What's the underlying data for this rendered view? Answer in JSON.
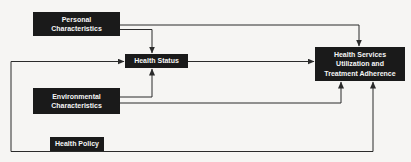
{
  "diagram": {
    "type": "flow-diagram",
    "colors": {
      "background": "#f6f5f3",
      "node_background": "#1a1a1a",
      "node_text": "#f5f5f5",
      "connector": "#2b2b2b"
    },
    "nodes": [
      {
        "id": "personal-characteristics",
        "label": "Personal Characteristics",
        "lines": [
          "Personal",
          "Characteristics"
        ]
      },
      {
        "id": "health-status",
        "label": "Health Status",
        "lines": [
          "Health Status"
        ]
      },
      {
        "id": "environmental-characteristics",
        "label": "Environmental Characteristics",
        "lines": [
          "Environmental",
          "Characteristics"
        ]
      },
      {
        "id": "health-policy",
        "label": "Health Policy",
        "lines": [
          "Health Policy"
        ]
      },
      {
        "id": "health-services",
        "label": "Health Services Utilization and Treatment Adherence",
        "lines": [
          "Health Services",
          "Utilization and",
          "Treatment Adherence"
        ]
      }
    ],
    "edges": [
      {
        "from": "personal-characteristics",
        "to": "health-services",
        "enters": "top"
      },
      {
        "from": "personal-characteristics",
        "to": "health-status",
        "enters": "top"
      },
      {
        "from": "health-status",
        "to": "health-services",
        "enters": "left"
      },
      {
        "from": "environmental-characteristics",
        "to": "health-status",
        "enters": "bottom"
      },
      {
        "from": "environmental-characteristics",
        "to": "health-services",
        "enters": "bottom"
      },
      {
        "from": "health-policy",
        "to": "health-status",
        "enters": "left"
      },
      {
        "from": "health-policy",
        "to": "health-services",
        "enters": "bottom"
      }
    ]
  }
}
